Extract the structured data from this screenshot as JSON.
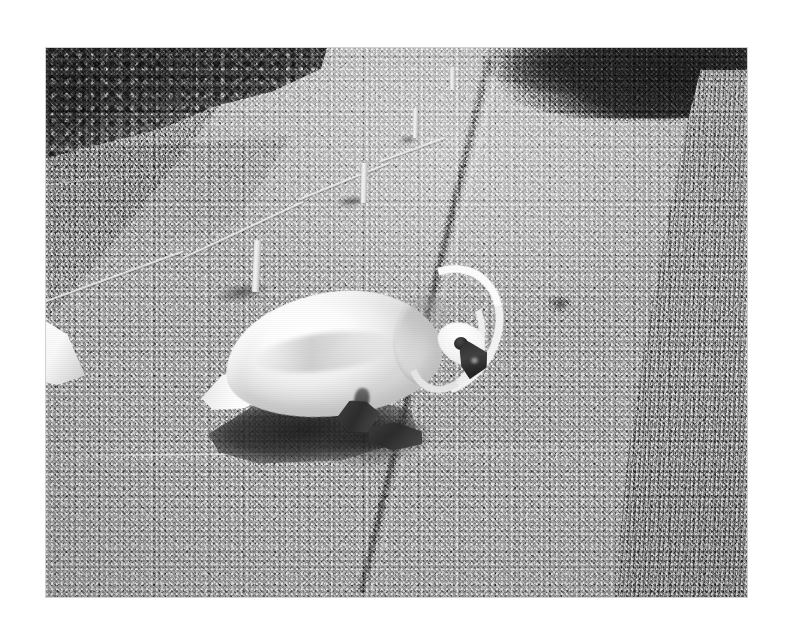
{
  "document": {
    "kind": "scanned-photograph",
    "orientation": "landscape",
    "color_mode": "black-and-white",
    "page_background": "#ffffff"
  },
  "photo": {
    "title": "Mute swan foraging on a gravel path",
    "border": {
      "left_px": 46,
      "top_px": 48,
      "width_px": 701,
      "height_px": 549
    },
    "tones": {
      "paper_white": "#ffffff",
      "gravel_midtone": "#9a9a9a",
      "gravel_highlight": "#c4c4c4",
      "grass_left": "#939393",
      "grass_right": "#8a8a8a",
      "hedge_dark": "#313131",
      "bush_shadow": "#1f1f1f",
      "swan_white": "#fafafa",
      "beak_black": "#232323",
      "cast_shadow": "#262626"
    }
  },
  "scene": {
    "subject": "swan",
    "setting": "gravel footpath between grass verges",
    "lighting": "bright low sun from upper left, hard cast shadows",
    "elements": [
      {
        "name": "gravel-path",
        "label": "Gravel path",
        "position": "centre, receding to vanishing point upper middle"
      },
      {
        "name": "grass-left",
        "label": "Left grass verge",
        "position": "upper left wedge"
      },
      {
        "name": "hedge-left",
        "label": "Dark hedge / foliage",
        "position": "top-left corner"
      },
      {
        "name": "bush-right",
        "label": "Dark bush shadow",
        "position": "top-right corner"
      },
      {
        "name": "grass-right",
        "label": "Right grass verge",
        "position": "right side"
      },
      {
        "name": "path-edging",
        "label": "Dark path edging line",
        "position": "right side, diagonal"
      },
      {
        "name": "rope-fence",
        "label": "Rope fence with white posts",
        "position": "left of path"
      },
      {
        "name": "white-object",
        "label": "Cut-off white object",
        "position": "left edge, mid-height"
      },
      {
        "name": "swan",
        "label": "Mute swan, head lowered",
        "position": "centre-left foreground"
      },
      {
        "name": "swan-shadow",
        "label": "Swan cast shadow",
        "position": "below and left of swan"
      }
    ]
  },
  "fence": {
    "label": "Rope fence",
    "post_count": 4,
    "posts": [
      {
        "name": "post-1",
        "label": "Fence post 1 (nearest)"
      },
      {
        "name": "post-2",
        "label": "Fence post 2"
      },
      {
        "name": "post-3",
        "label": "Fence post 3"
      },
      {
        "name": "post-4",
        "label": "Fence post 4 (farthest)"
      }
    ],
    "rope_segments": 4
  },
  "swan": {
    "label": "Mute swan",
    "pose": "neck curved down, beak at the ground, feeding",
    "parts": [
      {
        "name": "swan-body",
        "label": "Body"
      },
      {
        "name": "swan-tail",
        "label": "Tail"
      },
      {
        "name": "swan-neck",
        "label": "Neck"
      },
      {
        "name": "swan-head",
        "label": "Head"
      },
      {
        "name": "swan-beak",
        "label": "Beak with black knob"
      },
      {
        "name": "swan-feet",
        "label": "Webbed feet"
      }
    ]
  }
}
